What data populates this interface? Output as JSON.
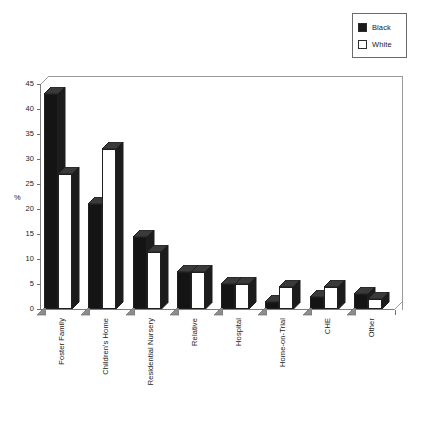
{
  "legend": {
    "position": "top-right",
    "entries": [
      {
        "label": "Black",
        "swatch": "filled-square-icon",
        "color": "#141414"
      },
      {
        "label": "White",
        "swatch": "empty-square-icon",
        "color": "#ffffff"
      }
    ]
  },
  "axes": {
    "y_label": "%",
    "y_ticks": [
      "45",
      "40",
      "35",
      "30",
      "25",
      "20",
      "15",
      "10",
      "5",
      "0"
    ]
  },
  "chart_data": {
    "type": "bar",
    "title": "",
    "subtitle": "",
    "xlabel": "",
    "ylabel": "%",
    "ylim": [
      0,
      45
    ],
    "ytick_step": 5,
    "grid": false,
    "legend_position": "top-right",
    "style": "grouped-3d-bar",
    "categories": [
      "Foster Family",
      "Children's Home",
      "Residential Nursery",
      "Relative",
      "Hospital",
      "Home-on-Trial",
      "CHE",
      "Other"
    ],
    "series": [
      {
        "name": "Black",
        "color": "#141414",
        "values": [
          43,
          21,
          14.5,
          7.5,
          5,
          1.5,
          2.5,
          3
        ]
      },
      {
        "name": "White",
        "color": "#ffffff",
        "values": [
          27,
          32,
          11.5,
          7.5,
          5,
          4.5,
          4.5,
          2
        ]
      }
    ]
  }
}
